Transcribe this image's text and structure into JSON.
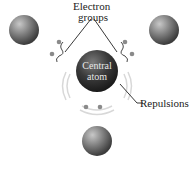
{
  "diagram": {
    "labels": {
      "electron_groups_line1": "Electron",
      "electron_groups_line2": "groups",
      "central_line1": "Central",
      "central_line2": "atom",
      "repulsions": "Repulsions"
    },
    "elements": {
      "central_atom": "dark gray sphere",
      "outer_atoms": [
        "upper-left sphere",
        "upper-right sphere",
        "bottom sphere"
      ],
      "electron_pairs": 3
    },
    "colors": {
      "sphere_light": "#b0b0b0",
      "sphere_dark": "#3a3a3a",
      "central_dark": "#2a2a2a",
      "line": "#222222"
    }
  }
}
